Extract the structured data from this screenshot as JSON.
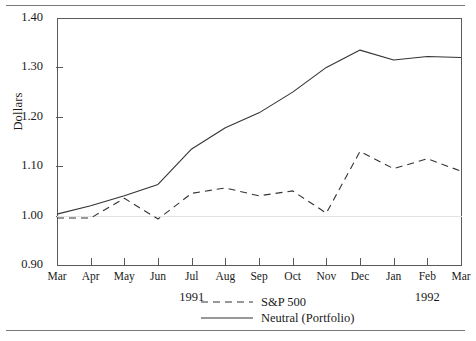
{
  "axis_label_y": "Dollars",
  "legend": {
    "items": [
      {
        "label": "S&P 500",
        "style": "dashed",
        "color": "#333333"
      },
      {
        "label": "Neutral (Portfolio)",
        "style": "solid",
        "color": "#333333"
      }
    ]
  },
  "years": [
    {
      "label": "1991",
      "at_index": 4
    },
    {
      "label": "1992",
      "at_index": 11
    }
  ],
  "chart_data": {
    "type": "line",
    "title": "",
    "xlabel": "",
    "ylabel": "Dollars",
    "ylim": [
      0.9,
      1.4
    ],
    "yticks": [
      "0.90",
      "1.00",
      "1.10",
      "1.20",
      "1.30",
      "1.40"
    ],
    "ytick_values": [
      0.9,
      1.0,
      1.1,
      1.2,
      1.3,
      1.4
    ],
    "grid": false,
    "legend_position": "bottom",
    "categories": [
      "Mar",
      "Apr",
      "May",
      "Jun",
      "Jul",
      "Aug",
      "Sep",
      "Oct",
      "Nov",
      "Dec",
      "Jan",
      "Feb",
      "Mar"
    ],
    "series": [
      {
        "name": "S&P 500",
        "style": "dashed",
        "values": [
          0.995,
          0.995,
          1.035,
          0.993,
          1.045,
          1.056,
          1.04,
          1.05,
          1.005,
          1.13,
          1.095,
          1.115,
          1.09
        ]
      },
      {
        "name": "Neutral (Portfolio)",
        "style": "solid",
        "values": [
          1.003,
          1.02,
          1.04,
          1.063,
          1.135,
          1.178,
          1.208,
          1.25,
          1.3,
          1.335,
          1.315,
          1.322,
          1.32
        ]
      }
    ]
  }
}
